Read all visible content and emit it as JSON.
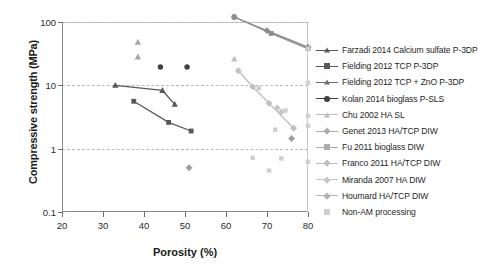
{
  "chart_data": {
    "type": "scatter",
    "title": "",
    "xlabel": "Porosity (%)",
    "ylabel": "Compressive strength (MPa)",
    "xlim": [
      20,
      80
    ],
    "ylim": [
      0.1,
      100
    ],
    "yscale": "log",
    "xticks": [
      20,
      30,
      40,
      50,
      60,
      70,
      80
    ],
    "yticks": [
      0.1,
      1,
      10,
      100
    ],
    "ytick_labels": [
      "0.1",
      "1",
      "10",
      "100"
    ],
    "grid": "horizontal-dashed",
    "legend_position": "right",
    "series": [
      {
        "name": "Farzadi 2014 Calcium sulfate P-3DP",
        "marker": "triangle",
        "color": "#595959",
        "line": true,
        "points": [
          [
            33.0,
            10.0
          ],
          [
            44.5,
            8.3
          ],
          [
            47.5,
            5.0
          ]
        ]
      },
      {
        "name": "Fielding 2012 TCP P-3DP",
        "marker": "square",
        "color": "#595959",
        "line": true,
        "points": [
          [
            37.5,
            5.6
          ],
          [
            46.0,
            2.6
          ],
          [
            51.5,
            1.9
          ]
        ]
      },
      {
        "name": "Fielding 2012 TCP + ZnO P-3DP",
        "marker": "triangle",
        "color": "#a6a6a6",
        "line": false,
        "points": [
          [
            38.5,
            48.0
          ],
          [
            38.5,
            28.0
          ]
        ]
      },
      {
        "name": "Kolan 2014 bioglass P-SLS",
        "marker": "circle",
        "color": "#404040",
        "line": false,
        "points": [
          [
            44.0,
            19.5
          ],
          [
            50.5,
            19.5
          ]
        ]
      },
      {
        "name": "Chu 2002 HA SL",
        "marker": "triangle",
        "color": "#bfbfbf",
        "line": false,
        "points": [
          [
            62.0,
            26.0
          ]
        ]
      },
      {
        "name": "Genet 2013 HA/TCP DIW",
        "marker": "diamond",
        "color": "#8c8c8c",
        "line": true,
        "points": [
          [
            62.0,
            120.0
          ],
          [
            70.0,
            73.0
          ],
          [
            80.0,
            40.0
          ]
        ]
      },
      {
        "name": "Fu 2011 bioglass DIW",
        "marker": "square",
        "color": "#8c8c8c",
        "line": true,
        "points": [
          [
            62.0,
            120.0
          ],
          [
            71.0,
            66.0
          ],
          [
            80.0,
            38.0
          ]
        ]
      },
      {
        "name": "Franco 2011 HA/TCP DIW",
        "marker": "diamond",
        "color": "#bfbfbf",
        "line": true,
        "points": [
          [
            63.0,
            17.0
          ],
          [
            66.5,
            9.5
          ],
          [
            70.5,
            5.2
          ],
          [
            76.5,
            2.1
          ]
        ]
      },
      {
        "name": "Miranda 2007 HA DIW",
        "marker": "diamond",
        "color": "#c6c6c6",
        "line": false,
        "points": [
          [
            72.5,
            4.4
          ],
          [
            73.5,
            3.8
          ]
        ]
      },
      {
        "name": "Houmard HA/TCP DIW",
        "marker": "diamond",
        "color": "#9d9d9d",
        "line": false,
        "points": [
          [
            51.0,
            0.5
          ],
          [
            76.0,
            1.45
          ]
        ]
      },
      {
        "name": "Non-AM processing",
        "marker": "square",
        "color": "#cfcfcf",
        "line": false,
        "points": [
          [
            68.0,
            9.0
          ],
          [
            74.5,
            4.0
          ],
          [
            72.0,
            2.0
          ],
          [
            80.0,
            11.0
          ],
          [
            80.0,
            3.3
          ],
          [
            80.0,
            2.3
          ],
          [
            80.0,
            0.62
          ],
          [
            80.0,
            38.0
          ],
          [
            66.5,
            0.72
          ],
          [
            73.5,
            0.7
          ],
          [
            70.5,
            0.45
          ]
        ]
      }
    ]
  },
  "legend": {
    "items": [
      {
        "label": "Farzadi 2014 Calcium sulfate P-3DP",
        "marker": "triangle",
        "color": "#595959",
        "line": true
      },
      {
        "label": "Fielding 2012 TCP P-3DP",
        "marker": "square",
        "color": "#595959",
        "line": true
      },
      {
        "label": "Fielding 2012 TCP + ZnO P-3DP",
        "marker": "triangle",
        "color": "#6e6e6e",
        "line": true
      },
      {
        "label": "Kolan 2014 bioglass P-SLS",
        "marker": "circle",
        "color": "#404040",
        "line": true
      },
      {
        "label": "Chu 2002 HA SL",
        "marker": "triangle",
        "color": "#bdbdbd",
        "line": true
      },
      {
        "label": "Genet 2013 HA/TCP DIW",
        "marker": "diamond",
        "color": "#adadad",
        "line": true
      },
      {
        "label": "Fu 2011 bioglass DIW",
        "marker": "square",
        "color": "#adadad",
        "line": true
      },
      {
        "label": "Franco 2011 HA/TCP DIW",
        "marker": "diamond",
        "color": "#bdbdbd",
        "line": true
      },
      {
        "label": "Miranda 2007 HA DIW",
        "marker": "diamond",
        "color": "#c6c6c6",
        "line": true
      },
      {
        "label": "Houmard HA/TCP DIW",
        "marker": "diamond",
        "color": "#b3b3b3",
        "line": true
      },
      {
        "label": "Non-AM processing",
        "marker": "square",
        "color": "#cfcfcf",
        "line": false
      }
    ]
  }
}
